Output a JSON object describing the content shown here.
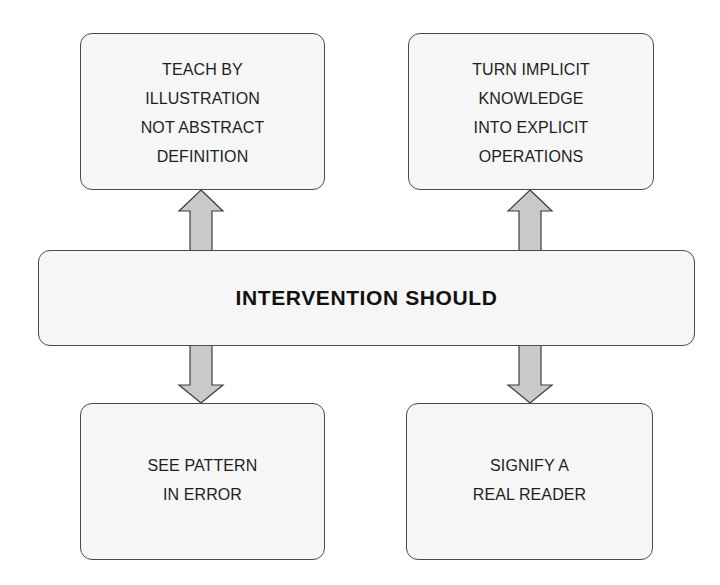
{
  "diagram": {
    "title": "INTERVENTION SHOULD",
    "center_node": {
      "label": "INTERVENTION SHOULD"
    },
    "nodes": [
      {
        "id": "top-left",
        "label": "TEACH BY\nILLUSTRATION\nNOT ABSTRACT\nDEFINITION",
        "direction_from_center": "up"
      },
      {
        "id": "top-right",
        "label": "TURN IMPLICIT\nKNOWLEDGE\nINTO EXPLICIT\nOPERATIONS",
        "direction_from_center": "up"
      },
      {
        "id": "bottom-left",
        "label": "SEE PATTERN\nIN ERROR",
        "direction_from_center": "down"
      },
      {
        "id": "bottom-right",
        "label": "SIGNIFY A\nREAL READER",
        "direction_from_center": "down"
      }
    ],
    "edges": [
      {
        "from": "center",
        "to": "top-left",
        "type": "block-arrow-up"
      },
      {
        "from": "center",
        "to": "top-right",
        "type": "block-arrow-up"
      },
      {
        "from": "center",
        "to": "bottom-left",
        "type": "block-arrow-down"
      },
      {
        "from": "center",
        "to": "bottom-right",
        "type": "block-arrow-down"
      }
    ],
    "colors": {
      "box_fill": "#f6f6f6",
      "box_border": "#4a4a4a",
      "arrow_fill": "#c9c9c9",
      "arrow_stroke": "#3c3c3c",
      "text": "#1e1e1e",
      "background": "#ffffff"
    }
  }
}
